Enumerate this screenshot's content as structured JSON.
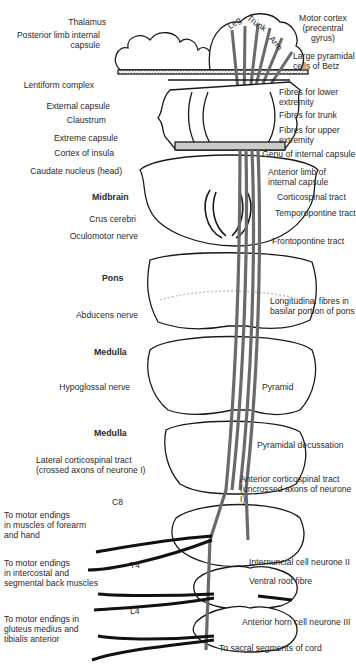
{
  "diagram": {
    "cortex_regions": [
      "Leg",
      "Trunk",
      "Arm"
    ],
    "labels_left": [
      {
        "id": "thalamus",
        "text": "Thalamus"
      },
      {
        "id": "posterior_limb",
        "text": "Posterior limb internal\ncapsule"
      },
      {
        "id": "lentiform",
        "text": "Lentiform complex"
      },
      {
        "id": "external_capsule",
        "text": "External capsule"
      },
      {
        "id": "claustrum",
        "text": "Claustrum"
      },
      {
        "id": "extreme_capsule",
        "text": "Extreme capsule"
      },
      {
        "id": "cortex_insula",
        "text": "Cortex of insula"
      },
      {
        "id": "caudate",
        "text": "Caudate nucleus (head)"
      },
      {
        "id": "crus_cerebri",
        "text": "Crus cerebri"
      },
      {
        "id": "oculomotor",
        "text": "Oculomotor nerve"
      },
      {
        "id": "abducens",
        "text": "Abducens nerve"
      },
      {
        "id": "hypoglossal",
        "text": "Hypoglossal nerve"
      },
      {
        "id": "lateral_cst",
        "text": "Lateral corticospinal tract\n(crossed axons of neurone I)"
      }
    ],
    "section_headings": [
      {
        "id": "midbrain",
        "text": "Midbrain"
      },
      {
        "id": "pons",
        "text": "Pons"
      },
      {
        "id": "medulla_1",
        "text": "Medulla"
      },
      {
        "id": "medulla_2",
        "text": "Medulla"
      }
    ],
    "segments": [
      "C8",
      "T4",
      "L4"
    ],
    "labels_right": [
      {
        "id": "motor_cortex",
        "text": "Motor cortex\n(precentral gyrus)"
      },
      {
        "id": "betz",
        "text": "Large pyramidal\ncells of Betz"
      },
      {
        "id": "fibres_lower",
        "text": "Fibres for lower\nextremity"
      },
      {
        "id": "fibres_trunk",
        "text": "Fibres for trunk"
      },
      {
        "id": "fibres_upper",
        "text": "Fibres for upper\nextremity"
      },
      {
        "id": "genu",
        "text": "Genu of internal capsule"
      },
      {
        "id": "anterior_limb",
        "text": "Anterior limb of\ninternal capsule"
      },
      {
        "id": "corticospinal",
        "text": "Corticospinal tract"
      },
      {
        "id": "temporopontine",
        "text": "Temporopontine tract"
      },
      {
        "id": "frontopontine",
        "text": "Frontopontine tract"
      },
      {
        "id": "longitudinal",
        "text": "Longitudinal fibres in\nbasilar portion of pons"
      },
      {
        "id": "pyramid",
        "text": "Pyramid"
      },
      {
        "id": "decussation",
        "text": "Pyramidal decussation"
      },
      {
        "id": "anterior_cst",
        "text": "Anterior corticospinal tract\n(uncrossed axons of neurone I)"
      },
      {
        "id": "internuncial",
        "text": "Internuncial cell neurone II"
      },
      {
        "id": "ventral_root",
        "text": "Ventral root fibre"
      },
      {
        "id": "anterior_horn",
        "text": "Anterior horn cell neurone III"
      },
      {
        "id": "sacral",
        "text": "To sacral segments of cord"
      }
    ],
    "motor_endings": [
      {
        "id": "forearm",
        "text": "To motor endings\nin muscles of forearm\nand hand"
      },
      {
        "id": "intercostal",
        "text": "To motor endings\nin intercostal and\nsegmental back muscles"
      },
      {
        "id": "gluteus",
        "text": "To motor endings in\ngluteus medius and\ntibialis anterior"
      }
    ],
    "colors": {
      "line": "#1a1a1a",
      "tract": "#6a6a6a",
      "fill": "#ffffff",
      "shade": "#d8d8d8"
    }
  }
}
